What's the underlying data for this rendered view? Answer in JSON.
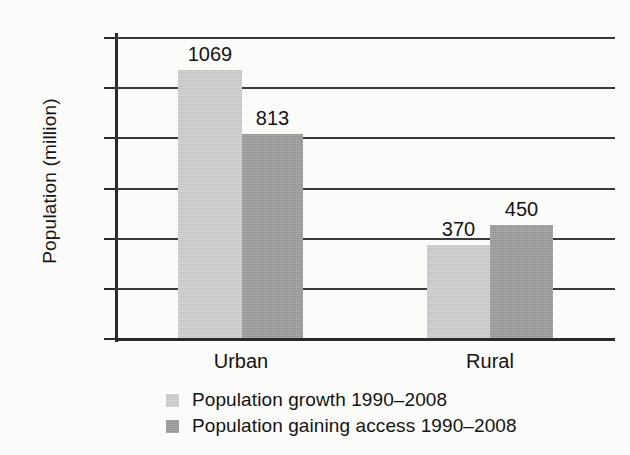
{
  "chart_data": {
    "type": "bar",
    "title": "",
    "xlabel": "",
    "ylabel": "Population (million)",
    "categories": [
      "Urban",
      "Rural"
    ],
    "series": [
      {
        "name": "Population growth 1990–2008",
        "values": [
          1069,
          370
        ],
        "color": "#cdcdcd"
      },
      {
        "name": "Population gaining access 1990–2008",
        "values": [
          813,
          450
        ],
        "color": "#9a9a9a"
      }
    ],
    "ylim": [
      0,
      1200
    ],
    "yticks": [
      0,
      200,
      400,
      600,
      800,
      1000,
      1200
    ],
    "ytick_labels": [
      "0",
      "200",
      "400",
      "600",
      "800",
      "1000",
      "1200"
    ],
    "grid": true,
    "legend_position": "bottom-left",
    "data_labels": [
      "1069",
      "813",
      "370",
      "450"
    ]
  },
  "axis": {
    "y_title": "Population (million)",
    "ticks": [
      {
        "label": "1200",
        "value": 1200
      },
      {
        "label": "1000",
        "value": 1000
      },
      {
        "label": "800",
        "value": 800
      },
      {
        "label": "600",
        "value": 600
      },
      {
        "label": "400",
        "value": 400
      },
      {
        "label": "200",
        "value": 200
      },
      {
        "label": "0",
        "value": 0
      }
    ]
  },
  "groups": [
    {
      "label": "Urban",
      "bars": [
        {
          "series": "growth",
          "value": 1069,
          "label": "1069",
          "shade": "light"
        },
        {
          "series": "access",
          "value": 813,
          "label": "813",
          "shade": "dark"
        }
      ]
    },
    {
      "label": "Rural",
      "bars": [
        {
          "series": "growth",
          "value": 370,
          "label": "370",
          "shade": "light"
        },
        {
          "series": "access",
          "value": 450,
          "label": "450",
          "shade": "dark"
        }
      ]
    }
  ],
  "legend": {
    "items": [
      {
        "label": "Population growth 1990–2008",
        "shade": "light"
      },
      {
        "label": "Population gaining access 1990–2008",
        "shade": "dark"
      }
    ]
  },
  "colors": {
    "light_bar": "#cdcdcd",
    "dark_bar": "#9a9a9a",
    "axis": "#2a2a2a",
    "grid": "#3a3a3a",
    "background": "#fbfbf9",
    "text": "#141414"
  }
}
